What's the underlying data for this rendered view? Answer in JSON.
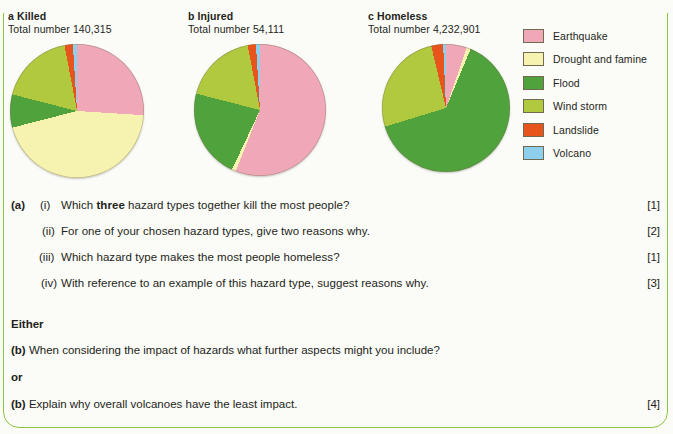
{
  "charts": [
    {
      "id": "a",
      "letter": "a",
      "title": "Killed",
      "total_label": "Total number 140,315",
      "total_value": 140315
    },
    {
      "id": "b",
      "letter": "b",
      "title": "Injured",
      "total_label": "Total number 54,111",
      "total_value": 54111
    },
    {
      "id": "c",
      "letter": "c",
      "title": "Homeless",
      "total_label": "Total number 4,232,901",
      "total_value": 4232901
    }
  ],
  "legend": {
    "items": [
      {
        "label": "Earthquake",
        "color": "#f0a8b8"
      },
      {
        "label": "Drought and famine",
        "color": "#f6f2b0"
      },
      {
        "label": "Flood",
        "color": "#4fa23c"
      },
      {
        "label": "Wind storm",
        "color": "#b0c93e"
      },
      {
        "label": "Landslide",
        "color": "#e8551c"
      },
      {
        "label": "Volcano",
        "color": "#8fcfee"
      }
    ]
  },
  "chart_data": [
    {
      "type": "pie",
      "id": "a",
      "title": "a Killed",
      "subtitle": "Total number 140,315",
      "categories": [
        "Earthquake",
        "Drought and famine",
        "Flood",
        "Wind storm",
        "Landslide",
        "Volcano"
      ],
      "values": [
        26,
        45,
        8,
        18,
        2,
        1
      ],
      "unit": "percent",
      "colors": [
        "#f0a8b8",
        "#f6f2b0",
        "#4fa23c",
        "#b0c93e",
        "#e8551c",
        "#8fcfee"
      ],
      "start_angle": 0,
      "direction": "clockwise",
      "legend_position": "right"
    },
    {
      "type": "pie",
      "id": "b",
      "title": "b Injured",
      "subtitle": "Total number 54,111",
      "categories": [
        "Earthquake",
        "Drought and famine",
        "Flood",
        "Wind storm",
        "Landslide",
        "Volcano"
      ],
      "values": [
        56,
        1,
        22,
        18,
        2,
        1
      ],
      "unit": "percent",
      "colors": [
        "#f0a8b8",
        "#f6f2b0",
        "#4fa23c",
        "#b0c93e",
        "#e8551c",
        "#8fcfee"
      ],
      "start_angle": 0,
      "direction": "clockwise",
      "legend_position": "right"
    },
    {
      "type": "pie",
      "id": "c",
      "title": "c Homeless",
      "subtitle": "Total number 4,232,901",
      "categories": [
        "Earthquake",
        "Drought and famine",
        "Flood",
        "Wind storm",
        "Landslide",
        "Volcano"
      ],
      "values": [
        5,
        1,
        64,
        26,
        3,
        1
      ],
      "unit": "percent",
      "colors": [
        "#f0a8b8",
        "#f6f2b0",
        "#4fa23c",
        "#b0c93e",
        "#e8551c",
        "#8fcfee"
      ],
      "start_angle": 1,
      "direction": "clockwise",
      "legend_position": "right"
    }
  ],
  "questions": {
    "part_a_label": "(a)",
    "items": [
      {
        "number": "(i)",
        "text": "Which three hazard types together kill the most people?",
        "bold_word": "three",
        "marks": "[1]"
      },
      {
        "number": "(ii)",
        "text": "For one of your chosen hazard types, give two reasons why.",
        "marks": "[2]"
      },
      {
        "number": "(iii)",
        "text": "Which hazard type makes the most people homeless?",
        "marks": "[1]"
      },
      {
        "number": "(iv)",
        "text": "With reference to an example of this hazard type, suggest reasons why.",
        "marks": "[3]"
      }
    ],
    "either_label": "Either",
    "option_1": {
      "label": "(b)",
      "text": "When considering the impact of hazards what further aspects might you include?",
      "marks": ""
    },
    "or_label": "or",
    "option_2": {
      "label": "(b)",
      "text": "Explain why overall volcanoes have the least impact.",
      "marks": "[4]"
    }
  }
}
